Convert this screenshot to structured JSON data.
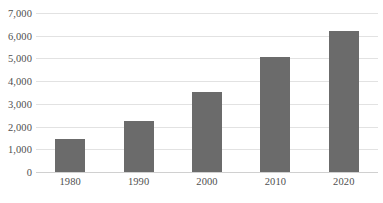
{
  "chart_data": {
    "type": "bar",
    "title": "",
    "subtitle": "",
    "xlabel": "",
    "ylabel": "",
    "categories": [
      "1980",
      "1990",
      "2000",
      "2010",
      "2020"
    ],
    "values": [
      1450,
      2230,
      3530,
      5050,
      6200
    ],
    "series": [
      {
        "name": "",
        "values": [
          1450,
          2230,
          3530,
          5050,
          6200
        ]
      }
    ],
    "ylim": [
      0,
      7000
    ],
    "ytick_step": 1000,
    "ytick_labels": [
      "0",
      "1,000",
      "2,000",
      "3,000",
      "4,000",
      "5,000",
      "6,000",
      "7,000"
    ],
    "ytick_values": [
      0,
      1000,
      2000,
      3000,
      4000,
      5000,
      6000,
      7000
    ],
    "grid": "horizontal",
    "legend": "none",
    "annotations": [],
    "colors": {
      "bar": "#6b6b6b",
      "gridline": "#e2e2e2",
      "baseline": "#d0d0d0",
      "tick_label": "#4f4f4f",
      "background": "#ffffff"
    }
  }
}
